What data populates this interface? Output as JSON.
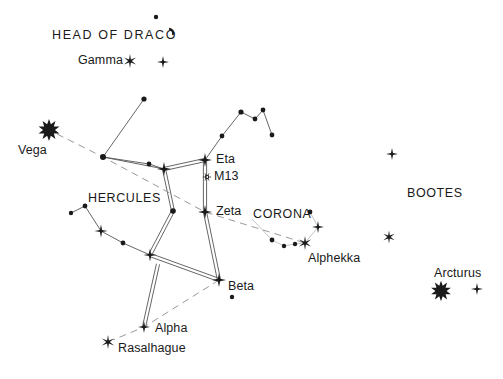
{
  "chart_data": {
    "type": "scatter",
    "title": "",
    "xlabel": "",
    "ylabel": "",
    "grid": false,
    "legend_position": "none",
    "xlim": [
      0,
      503
    ],
    "ylim": [
      0,
      379
    ],
    "background_color": "#ffffff",
    "ink_color": "#1a1a1a",
    "line_color": "#555555",
    "dashed_line_color": "#999999",
    "labels": [
      {
        "name": "head-of-draco",
        "text": "HEAD OF DRACO",
        "x": 52,
        "y": 29,
        "kind": "constellation"
      },
      {
        "name": "gamma",
        "text": "Gamma",
        "x": 78,
        "y": 54,
        "kind": "star"
      },
      {
        "name": "vega",
        "text": "Vega",
        "x": 18,
        "y": 144,
        "kind": "star"
      },
      {
        "name": "hercules",
        "text": "HERCULES",
        "x": 88,
        "y": 192,
        "kind": "constellation"
      },
      {
        "name": "eta",
        "text": "Eta",
        "x": 216,
        "y": 153,
        "kind": "star"
      },
      {
        "name": "m13",
        "text": "M13",
        "x": 214,
        "y": 170,
        "kind": "star"
      },
      {
        "name": "zeta",
        "text": "Zeta",
        "x": 216,
        "y": 205,
        "kind": "star"
      },
      {
        "name": "corona",
        "text": "CORONA",
        "x": 253,
        "y": 208,
        "kind": "constellation"
      },
      {
        "name": "alphekka",
        "text": "Alphekka",
        "x": 308,
        "y": 252,
        "kind": "star"
      },
      {
        "name": "beta",
        "text": "Beta",
        "x": 228,
        "y": 280,
        "kind": "star"
      },
      {
        "name": "alpha",
        "text": "Alpha",
        "x": 155,
        "y": 322,
        "kind": "star"
      },
      {
        "name": "rasalhague",
        "text": "Rasalhague",
        "x": 118,
        "y": 342,
        "kind": "star"
      },
      {
        "name": "bootes",
        "text": "BOOTES",
        "x": 407,
        "y": 187,
        "kind": "constellation"
      },
      {
        "name": "arcturus",
        "text": "Arcturus",
        "x": 434,
        "y": 267,
        "kind": "star"
      }
    ],
    "stars": [
      {
        "name": "vega-star",
        "x": 49,
        "y": 130,
        "mag": "bright",
        "style": "spiky-large",
        "r": 9
      },
      {
        "name": "gamma-draconis",
        "x": 130,
        "y": 61,
        "mag": "bright",
        "style": "spiky",
        "r": 7
      },
      {
        "name": "draco-star-2",
        "x": 163,
        "y": 62,
        "mag": "medium",
        "style": "cross",
        "r": 6
      },
      {
        "name": "draco-star-3",
        "x": 156,
        "y": 17,
        "mag": "faint",
        "style": "dot",
        "r": 2.2
      },
      {
        "name": "draco-star-4",
        "x": 172,
        "y": 31,
        "mag": "faint",
        "style": "comma",
        "r": 2.2
      },
      {
        "name": "hercules-north-dot",
        "x": 144,
        "y": 99,
        "mag": "faint",
        "style": "dot",
        "r": 2.6
      },
      {
        "name": "hercules-junction",
        "x": 103,
        "y": 157,
        "mag": "faint",
        "style": "dot",
        "r": 3.0
      },
      {
        "name": "hercules-dot-mid",
        "x": 149,
        "y": 164,
        "mag": "faint",
        "style": "dot",
        "r": 2.4
      },
      {
        "name": "hercules-pi",
        "x": 164,
        "y": 169,
        "mag": "medium",
        "style": "cross",
        "r": 7
      },
      {
        "name": "hercules-eta",
        "x": 205,
        "y": 160,
        "mag": "medium",
        "style": "cross",
        "r": 7
      },
      {
        "name": "m13-cluster",
        "x": 207,
        "y": 177,
        "mag": "cluster",
        "style": "cluster",
        "r": 3.4
      },
      {
        "name": "hercules-zeta",
        "x": 205,
        "y": 212,
        "mag": "medium",
        "style": "cross",
        "r": 7
      },
      {
        "name": "hercules-epsilon",
        "x": 173,
        "y": 211,
        "mag": "faint",
        "style": "dot",
        "r": 2.8
      },
      {
        "name": "hercules-beta",
        "x": 219,
        "y": 280,
        "mag": "medium",
        "style": "cross",
        "r": 7
      },
      {
        "name": "hercules-beta-companion",
        "x": 232,
        "y": 297,
        "mag": "faint",
        "style": "dot",
        "r": 2.2
      },
      {
        "name": "hercules-alpha",
        "x": 144,
        "y": 327,
        "mag": "medium",
        "style": "cross",
        "r": 6
      },
      {
        "name": "rasalhague-star",
        "x": 108,
        "y": 342,
        "mag": "bright",
        "style": "spiky",
        "r": 7
      },
      {
        "name": "hercules-arm-star",
        "x": 150,
        "y": 255,
        "mag": "medium",
        "style": "cross",
        "r": 6.5
      },
      {
        "name": "hercules-arm-dot",
        "x": 123,
        "y": 243,
        "mag": "faint",
        "style": "dot",
        "r": 2.4
      },
      {
        "name": "hercules-arm-bright",
        "x": 101,
        "y": 231,
        "mag": "medium",
        "style": "cross",
        "r": 6.5
      },
      {
        "name": "hercules-arm-dot2",
        "x": 85,
        "y": 206,
        "mag": "faint",
        "style": "dot",
        "r": 2.4
      },
      {
        "name": "hercules-arm-dot3",
        "x": 71,
        "y": 213,
        "mag": "faint",
        "style": "dot",
        "r": 2.2
      },
      {
        "name": "draco-chain-1",
        "x": 222,
        "y": 136,
        "mag": "faint",
        "style": "dot",
        "r": 2.4
      },
      {
        "name": "draco-chain-2",
        "x": 241,
        "y": 112,
        "mag": "faint",
        "style": "dot",
        "r": 2.6
      },
      {
        "name": "draco-chain-3",
        "x": 255,
        "y": 119,
        "mag": "faint",
        "style": "dot",
        "r": 2.4
      },
      {
        "name": "draco-chain-4",
        "x": 263,
        "y": 110,
        "mag": "faint",
        "style": "dot",
        "r": 2.4
      },
      {
        "name": "draco-chain-5",
        "x": 272,
        "y": 135,
        "mag": "faint",
        "style": "dot",
        "r": 2.4
      },
      {
        "name": "corona-dot-top",
        "x": 310,
        "y": 212,
        "mag": "faint",
        "style": "dot",
        "r": 2.4
      },
      {
        "name": "corona-star-cross",
        "x": 318,
        "y": 227,
        "mag": "medium",
        "style": "cross",
        "r": 6
      },
      {
        "name": "alphekka-star",
        "x": 305,
        "y": 243,
        "mag": "bright",
        "style": "spiky",
        "r": 7
      },
      {
        "name": "corona-dot-1",
        "x": 272,
        "y": 240,
        "mag": "faint",
        "style": "dot",
        "r": 2.4
      },
      {
        "name": "corona-dot-2",
        "x": 284,
        "y": 246,
        "mag": "faint",
        "style": "dot",
        "r": 2.2
      },
      {
        "name": "corona-dot-3",
        "x": 295,
        "y": 244,
        "mag": "faint",
        "style": "dot",
        "r": 2.2
      },
      {
        "name": "bootes-north",
        "x": 392,
        "y": 154,
        "mag": "medium",
        "style": "cross",
        "r": 6
      },
      {
        "name": "bootes-epsilon",
        "x": 389,
        "y": 237,
        "mag": "medium",
        "style": "spiky",
        "r": 6.5
      },
      {
        "name": "arcturus-star",
        "x": 441,
        "y": 291,
        "mag": "bright",
        "style": "spiky-large",
        "r": 8.5
      },
      {
        "name": "bootes-eta",
        "x": 477,
        "y": 289,
        "mag": "medium",
        "style": "cross",
        "r": 6
      }
    ],
    "lines": [
      {
        "name": "draco-upper-chain",
        "style": "solid",
        "points": [
          [
            205,
            160
          ],
          [
            222,
            136
          ],
          [
            241,
            112
          ],
          [
            255,
            119
          ],
          [
            263,
            110
          ],
          [
            272,
            135
          ]
        ]
      },
      {
        "name": "hercules-north-spur",
        "style": "solid",
        "points": [
          [
            144,
            99
          ],
          [
            103,
            157
          ]
        ]
      },
      {
        "name": "hercules-west-chain",
        "style": "solid",
        "points": [
          [
            103,
            157
          ],
          [
            149,
            164
          ],
          [
            164,
            169
          ]
        ]
      },
      {
        "name": "hercules-keystone-top",
        "style": "double",
        "points": [
          [
            164,
            169
          ],
          [
            205,
            160
          ]
        ]
      },
      {
        "name": "hercules-keystone-east",
        "style": "double",
        "points": [
          [
            205,
            160
          ],
          [
            205,
            212
          ],
          [
            219,
            280
          ]
        ]
      },
      {
        "name": "hercules-keystone-west",
        "style": "double",
        "points": [
          [
            164,
            169
          ],
          [
            173,
            211
          ],
          [
            150,
            255
          ]
        ]
      },
      {
        "name": "hercules-keystone-bottom",
        "style": "double",
        "points": [
          [
            150,
            255
          ],
          [
            219,
            280
          ]
        ]
      },
      {
        "name": "hercules-alpha-leg",
        "style": "double",
        "points": [
          [
            158,
            264
          ],
          [
            144,
            327
          ]
        ]
      },
      {
        "name": "hercules-arm",
        "style": "solid",
        "points": [
          [
            71,
            213
          ],
          [
            85,
            206
          ],
          [
            101,
            231
          ],
          [
            123,
            243
          ],
          [
            150,
            255
          ]
        ]
      },
      {
        "name": "hercules-lower-link",
        "style": "solid",
        "points": [
          [
            103,
            157
          ],
          [
            164,
            169
          ]
        ]
      },
      {
        "name": "corona-arc",
        "style": "thin",
        "points": [
          [
            252,
            219
          ],
          [
            272,
            240
          ],
          [
            284,
            246
          ],
          [
            295,
            244
          ],
          [
            305,
            243
          ],
          [
            318,
            227
          ],
          [
            310,
            212
          ]
        ]
      },
      {
        "name": "ecliptic-main",
        "style": "dashed",
        "points": [
          [
            57,
            134
          ],
          [
            103,
            157
          ],
          [
            205,
            212
          ],
          [
            305,
            243
          ]
        ]
      },
      {
        "name": "ecliptic-branch",
        "style": "dashed",
        "points": [
          [
            219,
            280
          ],
          [
            144,
            327
          ],
          [
            113,
            340
          ]
        ]
      }
    ]
  }
}
